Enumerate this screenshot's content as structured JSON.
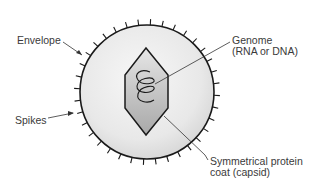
{
  "diagram": {
    "labels": {
      "envelope": "Envelope",
      "spikes": "Spikes",
      "genome": [
        "Genome",
        "(RNA or DNA)"
      ],
      "capsid": [
        "Symmetrical protein",
        "coat (capsid)"
      ]
    },
    "colors": {
      "envelope_fill": "#e6e6e6",
      "outline": "#1a1a1a",
      "capsid_fill": "#b8b8b8",
      "text": "#3a3a3a"
    }
  }
}
